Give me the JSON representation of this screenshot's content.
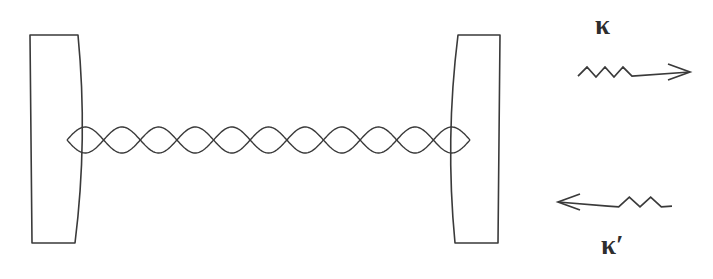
{
  "figure": {
    "kind": "optical-cavity-schematic",
    "background_color": "#ffffff",
    "stroke_color": "#3a3a3a",
    "label_color": "#2e2e2e",
    "width": 713,
    "height": 279
  },
  "cavity": {
    "left_mirror": {
      "name": "left-curved-mirror",
      "outer_x": 30,
      "inner_x": 78,
      "top_y": 35,
      "bottom_y": 243,
      "curvature_bulge": 10
    },
    "right_mirror": {
      "name": "right-curved-mirror",
      "inner_x": 455,
      "outer_x": 500,
      "top_y": 35,
      "bottom_y": 243,
      "curvature_bulge": 10
    },
    "standing_wave": {
      "name": "standing-wave-mode",
      "x_start": 67,
      "x_end": 470,
      "center_y": 140,
      "amplitude": 13,
      "antinodes": 11,
      "strand_count": 2
    }
  },
  "decay_channels": [
    {
      "id": "top",
      "name": "output-coupling-rate",
      "symbol": "κ",
      "direction": "right",
      "zigzag": {
        "x_start": 578,
        "x_end": 632,
        "peaks": 3,
        "amplitude": 9
      },
      "line": {
        "x_start": 632,
        "x_end": 690,
        "y": 72
      },
      "arrow_head_x": 690,
      "label_x": 600,
      "label_y": 12
    },
    {
      "id": "bottom",
      "name": "input-coupling-rate",
      "symbol": "κ′",
      "direction": "left",
      "zigzag": {
        "x_start": 608,
        "x_end": 672,
        "peaks": 3,
        "amplitude": 9
      },
      "line": {
        "x_start": 558,
        "x_end": 608,
        "y": 202
      },
      "arrow_head_x": 558,
      "label_x": 601,
      "label_y": 232
    }
  ],
  "labels": {
    "kappa_top": "κ",
    "kappa_bottom": "κ′"
  }
}
